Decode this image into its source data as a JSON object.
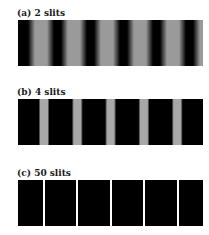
{
  "panels": [
    {
      "label": "(a) 2 slits",
      "pattern": "cos-squared",
      "top": 20,
      "period": 33,
      "first_peak": 41,
      "peak_width": 18,
      "bright_color": "#9a9a9a"
    },
    {
      "label": "(b) 4 slits",
      "pattern": "narrow peaks",
      "top": 99,
      "period": 33.3,
      "first_peak": 44,
      "peak_width": 9,
      "bright_color": "#a8a8a8"
    },
    {
      "label": "(c) 50 slits",
      "pattern": "very narrow lines",
      "top": 180,
      "period": 33.4,
      "first_peak": 44,
      "peak_width": 2,
      "bright_color": "#ffffff"
    }
  ],
  "colors": {
    "dark": "#000000",
    "background": "#ffffff"
  }
}
